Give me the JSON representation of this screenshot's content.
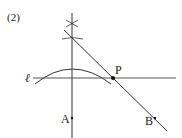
{
  "problem_number": "(2)",
  "labels": {
    "line": "ℓ",
    "point_p": "P",
    "point_a": "A",
    "point_b": "B"
  },
  "colors": {
    "stroke": "#333333",
    "text": "#222222",
    "background": "#ffffff"
  }
}
